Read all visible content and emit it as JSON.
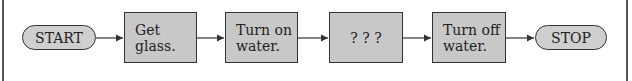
{
  "flowchart": {
    "start": {
      "label": "START"
    },
    "steps": [
      {
        "label": "Get\nglass."
      },
      {
        "label": "Turn on\nwater."
      },
      {
        "label": "? ? ?"
      },
      {
        "label": "Turn off\nwater."
      }
    ],
    "stop": {
      "label": "STOP"
    }
  },
  "colors": {
    "shape_fill": "#c8c8c8",
    "stroke": "#333333"
  }
}
